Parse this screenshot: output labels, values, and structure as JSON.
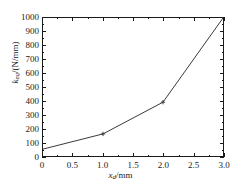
{
  "chart_data": {
    "type": "line",
    "title": "",
    "xlabel": "x_d/mm",
    "xlabel_symbol": "x",
    "xlabel_subscript": "d",
    "xlabel_unit": "/mm",
    "ylabel": "k_eq/(N/mm)",
    "ylabel_symbol": "k",
    "ylabel_subscript": "eq",
    "ylabel_unit": "/(N/mm)",
    "x": [
      0,
      1.0,
      2.0,
      3.0
    ],
    "values": [
      50,
      160,
      390,
      1000
    ],
    "series": [
      {
        "name": "k_eq",
        "x": [
          0,
          1.0,
          2.0,
          3.0
        ],
        "values": [
          50,
          160,
          390,
          1000
        ]
      }
    ],
    "markers_at": [
      1.0,
      2.0
    ],
    "xlim": [
      0,
      3.0
    ],
    "ylim": [
      0,
      1000
    ],
    "xticks": [
      0,
      0.5,
      1.0,
      1.5,
      2.0,
      2.5,
      3.0
    ],
    "xtick_labels": [
      "0",
      "0.5",
      "1.0",
      "1.5",
      "2.0",
      "2.5",
      "3.0"
    ],
    "xminor_step": 0.25,
    "yticks": [
      0,
      100,
      200,
      300,
      400,
      500,
      600,
      700,
      800,
      900,
      1000
    ],
    "ytick_labels": [
      "0",
      "100",
      "200",
      "300",
      "400",
      "500",
      "600",
      "700",
      "800",
      "900",
      "1000"
    ],
    "grid": false,
    "legend": null,
    "line_color": "#3a3a3a",
    "axis_color": "#1a1a1a",
    "background": "#ffffff"
  }
}
